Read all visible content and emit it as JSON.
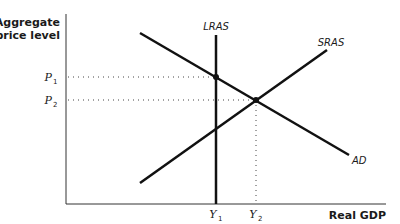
{
  "diagram": {
    "type": "AD-AS model",
    "y_axis": {
      "title_line1": "Aggregate",
      "title_line2": "price level"
    },
    "x_axis": {
      "title": "Real GDP"
    },
    "curves": {
      "lras": {
        "label": "LRAS"
      },
      "sras": {
        "label": "SRAS"
      },
      "ad": {
        "label": "AD"
      }
    },
    "price_levels": [
      {
        "symbol": "P",
        "subscript": "1"
      },
      {
        "symbol": "P",
        "subscript": "2"
      }
    ],
    "output_levels": [
      {
        "symbol": "Y",
        "subscript": "1"
      },
      {
        "symbol": "Y",
        "subscript": "2"
      }
    ],
    "colors": {
      "line": "#111111",
      "axis": "#333333",
      "guide": "#444444"
    }
  }
}
